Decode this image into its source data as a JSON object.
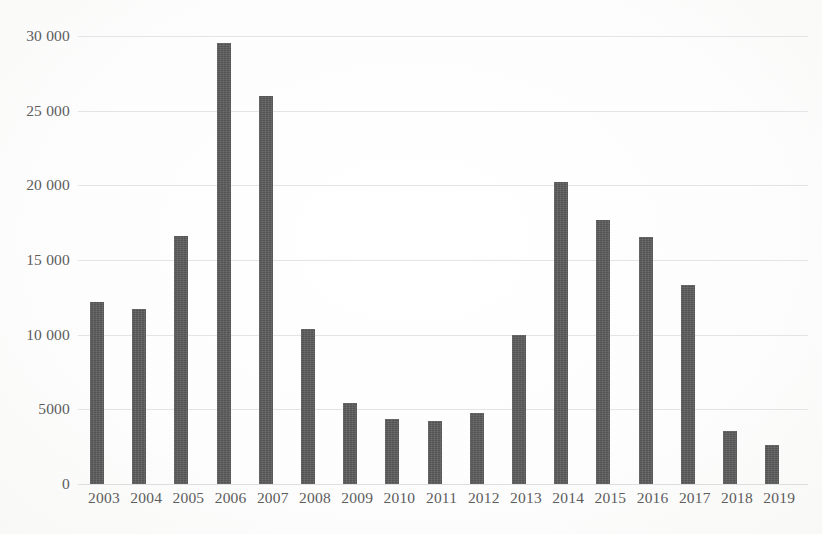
{
  "chart_data": {
    "type": "bar",
    "title": "",
    "subtitle": "",
    "xlabel": "",
    "ylabel": "",
    "categories": [
      "2003",
      "2004",
      "2005",
      "2006",
      "2007",
      "2008",
      "2009",
      "2010",
      "2011",
      "2012",
      "2013",
      "2014",
      "2015",
      "2016",
      "2017",
      "2018",
      "2019"
    ],
    "values": [
      12200,
      11750,
      16600,
      29500,
      26000,
      10350,
      5450,
      4350,
      4250,
      4750,
      9950,
      20250,
      17650,
      16550,
      13350,
      3550,
      2600
    ],
    "ylim": [
      0,
      30000
    ],
    "yticks": [
      0,
      5000,
      10000,
      15000,
      20000,
      25000,
      30000
    ],
    "ytick_labels": [
      "0",
      "5000",
      "10 000",
      "15 000",
      "20 000",
      "25 000",
      "30 000"
    ],
    "grid": true,
    "legend": "none",
    "series": [
      {
        "name": "",
        "color": "#5c5c5c",
        "values": [
          12200,
          11750,
          16600,
          29500,
          26000,
          10350,
          5450,
          4350,
          4250,
          4750,
          9950,
          20250,
          17650,
          16550,
          13350,
          3550,
          2600
        ]
      }
    ]
  },
  "style": {
    "bar_color": "#5c5c5c",
    "grid_color": "#e3e3e3",
    "text_color": "#5d5d5d",
    "background": "#ffffff"
  }
}
